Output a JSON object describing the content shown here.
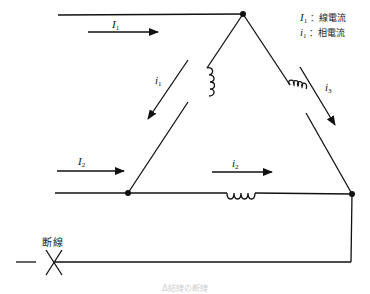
{
  "diagram": {
    "type": "delta-connection-circuit",
    "nodes": {
      "top": {
        "x": 243,
        "y": 14
      },
      "bottom_left": {
        "x": 128,
        "y": 193
      },
      "bottom_right": {
        "x": 352,
        "y": 194
      }
    },
    "lines": {
      "line1_label": "I",
      "line1_sub": "1",
      "line2_label": "I",
      "line2_sub": "2"
    },
    "phases": {
      "phase1_label": "i",
      "phase1_sub": "1",
      "phase2_label": "i",
      "phase2_sub": "2",
      "phase3_label": "i",
      "phase3_sub": "3"
    },
    "legend": {
      "row1_symbol": "I",
      "row1_sub": "1",
      "row1_text": "：線電流",
      "row2_symbol": "i",
      "row2_sub": "1",
      "row2_text": "：相電流"
    },
    "break_label": "断線",
    "caption": "Δ結線の断線"
  },
  "colors": {
    "line": "#111111",
    "background": "#ffffff"
  }
}
